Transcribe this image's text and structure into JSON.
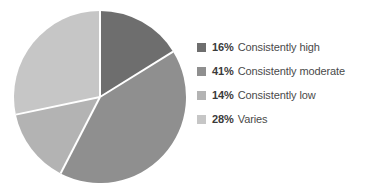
{
  "chart_data": {
    "type": "pie",
    "title": "",
    "categories": [
      "Consistently high",
      "Consistently moderate",
      "Consistently low",
      "Varies"
    ],
    "values": [
      16,
      41,
      14,
      28
    ],
    "value_unit": "%",
    "start_angle_deg": 0,
    "direction": "clockwise",
    "legend_position": "right",
    "grid": false,
    "colors": [
      "#6e6e6e",
      "#8f8f8f",
      "#b3b3b3",
      "#c6c6c6"
    ],
    "slice_divider_color": "#ffffff",
    "background_color": "#ffffff",
    "slices": [
      {
        "label": "Consistently high",
        "value": 16,
        "percent_text": "16%",
        "color": "#6e6e6e"
      },
      {
        "label": "Consistently moderate",
        "value": 41,
        "percent_text": "41%",
        "color": "#8f8f8f"
      },
      {
        "label": "Consistently low",
        "value": 14,
        "percent_text": "14%",
        "color": "#b3b3b3"
      },
      {
        "label": "Varies",
        "value": 28,
        "percent_text": "28%",
        "color": "#c6c6c6"
      }
    ]
  },
  "legend": {
    "items": [
      {
        "percent": "16%",
        "label": "Consistently high",
        "color": "#6e6e6e"
      },
      {
        "percent": "41%",
        "label": "Consistently moderate",
        "color": "#8f8f8f"
      },
      {
        "percent": "14%",
        "label": "Consistently low",
        "color": "#b3b3b3"
      },
      {
        "percent": "28%",
        "label": "Varies",
        "color": "#c6c6c6"
      }
    ]
  }
}
